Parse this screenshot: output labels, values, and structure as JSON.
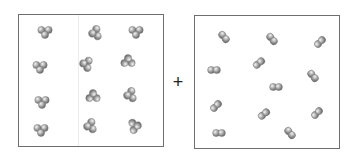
{
  "diagram": {
    "title": "",
    "operator": "+",
    "colors": {
      "border": "#6e6e6e",
      "atom_fill": "#a8a8a8",
      "atom_dark": "#6a6a6a",
      "atom_light": "#f2f2f2"
    },
    "left_box": {
      "label": "triatomic molecules",
      "molecule_type": "triatomic",
      "count": 12,
      "molecules": [
        {
          "x": 45,
          "y": 32,
          "rot": 0
        },
        {
          "x": 95,
          "y": 33,
          "rot": 80
        },
        {
          "x": 136,
          "y": 32,
          "rot": 0
        },
        {
          "x": 40,
          "y": 67,
          "rot": 0
        },
        {
          "x": 86,
          "y": 64,
          "rot": 100
        },
        {
          "x": 128,
          "y": 61,
          "rot": 180
        },
        {
          "x": 42,
          "y": 102,
          "rot": 0
        },
        {
          "x": 93,
          "y": 96,
          "rot": 180
        },
        {
          "x": 130,
          "y": 95,
          "rot": 80
        },
        {
          "x": 41,
          "y": 130,
          "rot": 0
        },
        {
          "x": 90,
          "y": 126,
          "rot": 80
        },
        {
          "x": 135,
          "y": 126,
          "rot": 260
        }
      ]
    },
    "right_box": {
      "label": "diatomic molecules",
      "molecule_type": "diatomic",
      "count": 12,
      "molecules": [
        {
          "x": 224,
          "y": 37,
          "rot": 50
        },
        {
          "x": 272,
          "y": 39,
          "rot": 50
        },
        {
          "x": 320,
          "y": 42,
          "rot": -45
        },
        {
          "x": 214,
          "y": 70,
          "rot": 0
        },
        {
          "x": 259,
          "y": 63,
          "rot": -40
        },
        {
          "x": 313,
          "y": 76,
          "rot": 50
        },
        {
          "x": 276,
          "y": 87,
          "rot": 0
        },
        {
          "x": 216,
          "y": 106,
          "rot": -45
        },
        {
          "x": 264,
          "y": 114,
          "rot": -40
        },
        {
          "x": 317,
          "y": 113,
          "rot": -45
        },
        {
          "x": 219,
          "y": 133,
          "rot": 0
        },
        {
          "x": 290,
          "y": 133,
          "rot": 50
        }
      ]
    }
  }
}
